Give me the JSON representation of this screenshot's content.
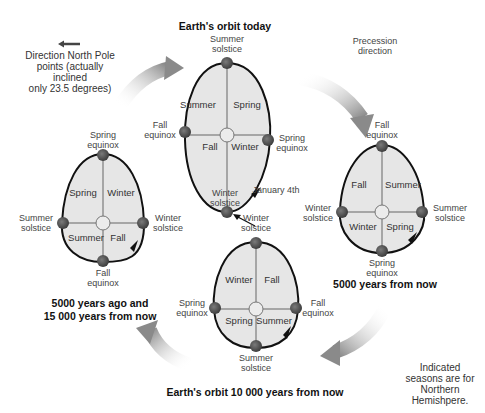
{
  "legend": {
    "arrow_text_1": "Direction North Pole",
    "arrow_text_2": "points (actually inclined",
    "arrow_text_3": "only 23.5 degrees)"
  },
  "precession": {
    "line1": "Precession",
    "line2": "direction"
  },
  "note": {
    "line1": "Indicated",
    "line2": "seasons are for",
    "line3": "Northern",
    "line4": "Hemishpere."
  },
  "orbits": [
    {
      "title": "Earth's orbit today",
      "seasons": {
        "tl": "Summer",
        "tr": "Spring",
        "bl": "Fall",
        "br": "Winter"
      },
      "points": {
        "top": [
          "Summer",
          "solstice"
        ],
        "left": [
          "Fall",
          "equinox"
        ],
        "right": [
          "Spring",
          "equinox"
        ],
        "bottom": [
          "Winter",
          "solstice"
        ]
      },
      "perihelion": "January 4th"
    },
    {
      "title": "5000 years from now",
      "seasons": {
        "tl": "Fall",
        "tr": "Summer",
        "bl": "Winter",
        "br": "Spring"
      },
      "points": {
        "top": [
          "Fall",
          "equinox"
        ],
        "left": [
          "Winter",
          "solstice"
        ],
        "right": [
          "Summer",
          "solstice"
        ],
        "bottom": [
          "Spring",
          "equinox"
        ]
      }
    },
    {
      "title": "Earth's orbit 10 000 years from now",
      "seasons": {
        "tl": "Winter",
        "tr": "Fall",
        "bl": "Spring",
        "br": "Summer"
      },
      "points": {
        "top": [
          "Winter",
          "solstice"
        ],
        "left": [
          "Spring",
          "equinox"
        ],
        "right": [
          "Fall",
          "equinox"
        ],
        "bottom": [
          "Summer",
          "solstice"
        ]
      }
    },
    {
      "title_line1": "5000 years ago and",
      "title_line2": "15 000 years from now",
      "seasons": {
        "tl": "Spring",
        "tr": "Winter",
        "bl": "Summer",
        "br": "Fall"
      },
      "points": {
        "top": [
          "Spring",
          "equinox"
        ],
        "left": [
          "Summer",
          "solstice"
        ],
        "right": [
          "Winter",
          "solstice"
        ],
        "bottom": [
          "Fall",
          "equinox"
        ]
      }
    }
  ],
  "colors": {
    "ellipse_fill": "#e6e6e6",
    "ellipse_stroke": "#111111",
    "earth": "#5a5a5a",
    "sun": "#ececec",
    "arrow": "#8c8c8c"
  }
}
